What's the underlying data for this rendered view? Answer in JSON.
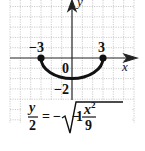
{
  "diagram": {
    "type": "function-graph",
    "axes": {
      "x_label": "x",
      "y_label": "y"
    },
    "grid": {
      "x_min": -6,
      "x_max": 6,
      "y_min": -6,
      "y_max": 5.5,
      "step": 1
    },
    "curve": {
      "shape": "lower semi-ellipse",
      "from": [
        -3,
        0
      ],
      "to": [
        3,
        0
      ],
      "vertex": [
        0,
        -2
      ],
      "color": "#111111"
    },
    "endpoints": [
      {
        "x": -3,
        "y": 0
      },
      {
        "x": 3,
        "y": 0
      }
    ],
    "tick_labels": {
      "neg_three": "−3",
      "pos_three": "3",
      "origin": "0",
      "neg_two": "−2"
    },
    "equation": {
      "lhs_num": "y",
      "lhs_den": "2",
      "equals": "=",
      "minus": "−",
      "radicand_one": "1",
      "radicand_minus": "−",
      "rad_num": "x",
      "rad_num_exp": "2",
      "rad_den": "9",
      "text": "y/2 = −√(1 − x²/9)"
    }
  }
}
